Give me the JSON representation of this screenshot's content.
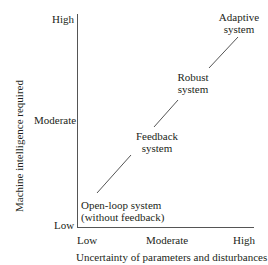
{
  "axes": {
    "y_label": "Machine intelligence required",
    "x_label": "Uncertainty of parameters and disturbances",
    "y_ticks": [
      "High",
      "Moderate",
      "Low"
    ],
    "x_ticks": [
      "Low",
      "Moderate",
      "High"
    ]
  },
  "nodes": [
    {
      "line1": "Open-loop system",
      "line2": "(without feedback)"
    },
    {
      "line1": "Feedback",
      "line2": "system"
    },
    {
      "line1": "Robust",
      "line2": "system"
    },
    {
      "line1": "Adaptive",
      "line2": "system"
    }
  ],
  "colors": {
    "ink": "#231f20",
    "line": "#555555"
  }
}
